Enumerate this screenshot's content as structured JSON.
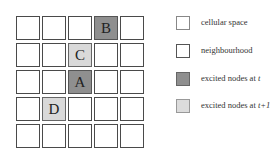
{
  "diagram": {
    "grid": {
      "rows": 5,
      "cols": 5,
      "cells": [
        {
          "row": 0,
          "col": 3,
          "label": "B",
          "state": "excited-t"
        },
        {
          "row": 1,
          "col": 2,
          "label": "C",
          "state": "excited-t1"
        },
        {
          "row": 2,
          "col": 2,
          "label": "A",
          "state": "excited-t"
        },
        {
          "row": 3,
          "col": 1,
          "label": "D",
          "state": "excited-t1"
        }
      ]
    },
    "legend": [
      {
        "swatch": "cellular-space",
        "label": "cellular space"
      },
      {
        "swatch": "neighbourhood",
        "label": "neighbourhood"
      },
      {
        "swatch": "excited-t",
        "label_prefix": "excited nodes at ",
        "label_var": "t"
      },
      {
        "swatch": "excited-t1",
        "label_prefix": "excited nodes at ",
        "label_var": "t+1"
      }
    ],
    "colors": {
      "excited_t": "#8f8f8f",
      "excited_t1": "#d9d9d9",
      "border": "#555555"
    }
  }
}
